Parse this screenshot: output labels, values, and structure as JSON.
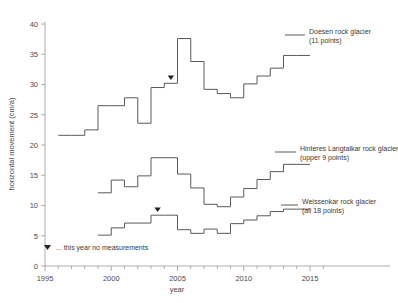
{
  "chart_data": {
    "type": "line",
    "style": "step-post",
    "title": "",
    "xlabel": "year",
    "ylabel": "horizontal movement (cm/a)",
    "xlim": [
      1995,
      2016
    ],
    "ylim": [
      0,
      40
    ],
    "xticks": [
      1995,
      2000,
      2005,
      2010,
      2015
    ],
    "xtick_labels": [
      "1995",
      "2000",
      "2005",
      "2010",
      "2015"
    ],
    "minor_xticks_every": 1,
    "yticks": [
      0,
      5,
      10,
      15,
      20,
      25,
      30,
      35,
      40
    ],
    "ytick_labels": [
      "0",
      "5",
      "10",
      "15",
      "20",
      "25",
      "30",
      "35",
      "40"
    ],
    "grid": false,
    "legend_position": "right-inline",
    "series": [
      {
        "name": "Doesen rock glacier",
        "detail": "(11 points)",
        "legend_label_line1": "Doesen rock glacier",
        "legend_label_line2": "(11 points)",
        "color": "#5a5a5a",
        "x": [
          1996,
          1997,
          1998,
          1999,
          2000,
          2001,
          2002,
          2003,
          2004,
          2005,
          2006,
          2007,
          2008,
          2009,
          2010,
          2011,
          2012,
          2013,
          2014
        ],
        "y": [
          21.6,
          21.6,
          22.5,
          26.5,
          26.5,
          27.8,
          23.6,
          29.5,
          30.2,
          37.6,
          33.8,
          29.2,
          28.5,
          27.8,
          30.1,
          31.4,
          32.7,
          34.8,
          34.8
        ],
        "no_measurement_years": [
          2004
        ]
      },
      {
        "name": "Hinteres Langtalkar rock glacier",
        "detail": "(upper 9 points)",
        "legend_label_line1": "Hinteres Langtalkar rock glacier",
        "legend_label_line2": "(upper 9 points)",
        "color": "#5a5a5a",
        "x": [
          1999,
          2000,
          2001,
          2002,
          2003,
          2004,
          2005,
          2006,
          2007,
          2008,
          2009,
          2010,
          2011,
          2012,
          2013,
          2014
        ],
        "y": [
          12.1,
          14.2,
          13.1,
          14.9,
          17.9,
          17.9,
          15.2,
          12.9,
          10.2,
          9.8,
          11.4,
          12.8,
          14.3,
          15.6,
          16.8,
          16.8
        ],
        "no_measurement_years": []
      },
      {
        "name": "Weissenkar rock glacier",
        "detail": "(all 18 points)",
        "legend_label_line1": "Weissenkar rock glacier",
        "legend_label_line2": "(all 18 points)",
        "color": "#5a5a5a",
        "x": [
          1999,
          2000,
          2001,
          2002,
          2003,
          2004,
          2005,
          2006,
          2007,
          2008,
          2009,
          2010,
          2011,
          2012,
          2013,
          2014
        ],
        "y": [
          5.1,
          6.3,
          7.1,
          7.1,
          8.4,
          8.4,
          6.0,
          5.4,
          6.1,
          5.4,
          7.0,
          7.6,
          8.3,
          9.0,
          9.4,
          9.4
        ],
        "no_measurement_years": [
          2003
        ]
      }
    ],
    "annotations": [
      {
        "name": "no-measurement-note",
        "glyph": "▼",
        "text": "... this year no measurements"
      }
    ]
  },
  "axes": {
    "y_title": "horizontal movement (cm/a)",
    "x_title": "year"
  }
}
